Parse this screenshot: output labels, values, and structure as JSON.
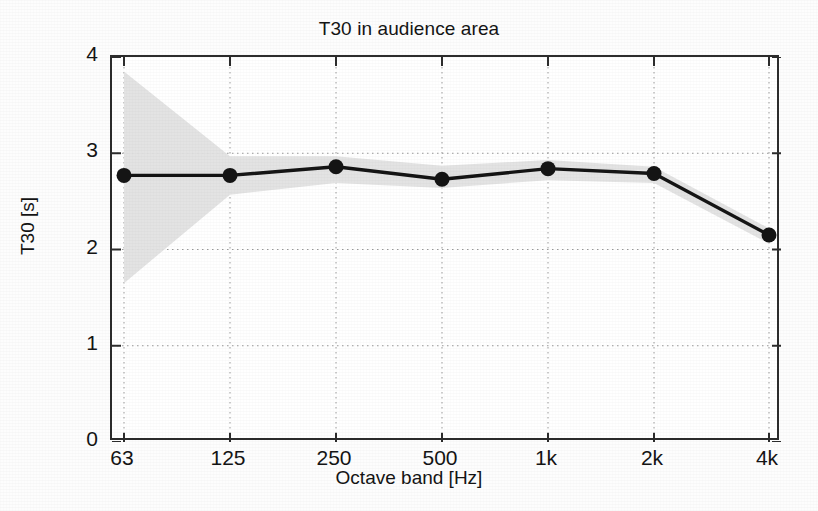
{
  "chart_data": {
    "type": "line",
    "title": "T30 in audience area",
    "xlabel": "Octave band [Hz]",
    "ylabel": "T30 [s]",
    "categories": [
      "63",
      "125",
      "250",
      "500",
      "1k",
      "2k",
      "4k"
    ],
    "xtick_labels": [
      "63",
      "125",
      "250",
      "500",
      "1k",
      "2k",
      "4k"
    ],
    "ytick_labels": [
      "0",
      "1",
      "2",
      "3",
      "4"
    ],
    "ytick_values": [
      0,
      1,
      2,
      3,
      4
    ],
    "ylim": [
      0,
      4
    ],
    "grid": true,
    "grid_style": "dotted",
    "legend": "none",
    "series": [
      {
        "name": "T30 mean",
        "style": "line-with-circle-markers",
        "color": "#141414",
        "values": [
          2.77,
          2.77,
          2.86,
          2.73,
          2.84,
          2.79,
          2.15
        ]
      }
    ],
    "band": {
      "name": "spatial spread",
      "color": "#e2e2e2",
      "upper": [
        3.85,
        2.97,
        2.97,
        2.87,
        2.93,
        2.86,
        2.22
      ],
      "lower": [
        1.65,
        2.57,
        2.69,
        2.64,
        2.72,
        2.69,
        2.06
      ]
    }
  },
  "axes": {
    "title": "T30 in audience area",
    "x_title": "Octave band [Hz]",
    "y_title": "T30 [s]"
  }
}
